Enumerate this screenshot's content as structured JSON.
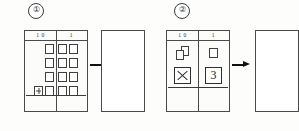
{
  "worksheet": {
    "panels": [
      {
        "label": "①",
        "label_name": "circled-one",
        "chart": {
          "columns": [
            "1 0",
            "1"
          ],
          "tens_column": {
            "header": "1 0",
            "rows": [
              {
                "items": [
                  "square"
                ]
              },
              {
                "items": [
                  "square"
                ]
              },
              {
                "items": [
                  "square"
                ]
              },
              {
                "items": [
                  "plus-square",
                  "square"
                ]
              }
            ]
          },
          "ones_column": {
            "header": "1",
            "rows": [
              {
                "items": [
                  "square",
                  "square"
                ]
              },
              {
                "items": [
                  "square",
                  "square"
                ]
              },
              {
                "items": [
                  "square",
                  "square"
                ]
              },
              {
                "items": [
                  "square",
                  "square"
                ]
              }
            ]
          }
        },
        "arrow": "right-arrow",
        "target": {
          "value": ""
        }
      },
      {
        "label": "②",
        "label_name": "circled-two",
        "chart": {
          "columns": [
            "1 0",
            "1"
          ],
          "tens_column": {
            "header": "1 0",
            "icon": "stacked-squares",
            "answer": "X"
          },
          "ones_column": {
            "header": "1",
            "icon": "single-square",
            "answer": "3"
          }
        },
        "arrow": "right-arrow",
        "target": {
          "value": ""
        }
      }
    ]
  },
  "colors": {
    "ink": "#2e2e2e",
    "rule": "#4a4a4a",
    "paper": "#fdfdfc",
    "arrow": "#111111"
  }
}
